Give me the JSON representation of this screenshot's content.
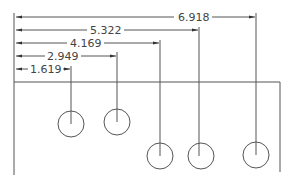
{
  "drawing": {
    "type": "ordinate-dimension-drawing",
    "colors": {
      "line": "#555555",
      "text": "#444444",
      "background": "#ffffff"
    },
    "origin_x": 14,
    "part_outline": {
      "top_y": 82,
      "left_x": 14,
      "right_x": 280,
      "bottom_y": 175
    },
    "dimensions": [
      {
        "label": "6.918",
        "y": 17,
        "x_end": 256,
        "text_x": 178
      },
      {
        "label": "5.322",
        "y": 30,
        "x_end": 199,
        "text_x": 90
      },
      {
        "label": "4.169",
        "y": 43,
        "x_end": 160,
        "text_x": 70
      },
      {
        "label": "2.949",
        "y": 56,
        "x_end": 117,
        "text_x": 47
      },
      {
        "label": "1.619",
        "y": 69,
        "x_end": 71,
        "text_x": 30
      }
    ],
    "holes": [
      {
        "cx": 71,
        "cy": 124,
        "r": 13
      },
      {
        "cx": 117,
        "cy": 122,
        "r": 13
      },
      {
        "cx": 160,
        "cy": 156,
        "r": 13
      },
      {
        "cx": 201,
        "cy": 156,
        "r": 13
      },
      {
        "cx": 256,
        "cy": 155,
        "r": 13
      }
    ]
  }
}
